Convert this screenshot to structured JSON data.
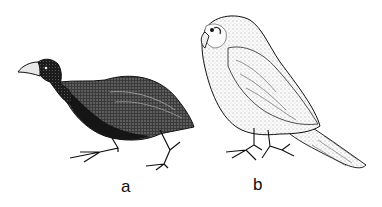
{
  "figure": {
    "panels": [
      {
        "label": "a",
        "subject": "dark, plump ground bird (rail-like) with heavy pale bill, walking pose"
      },
      {
        "label": "b",
        "subject": "light, finely stippled parrot-like bird (kakapo-like) with hooked beak, standing side view"
      }
    ],
    "colors": {
      "ink": "#111111",
      "background": "#ffffff",
      "dark_plumage": "#1a1a1a",
      "light_plumage": "#f4f4f4"
    }
  }
}
